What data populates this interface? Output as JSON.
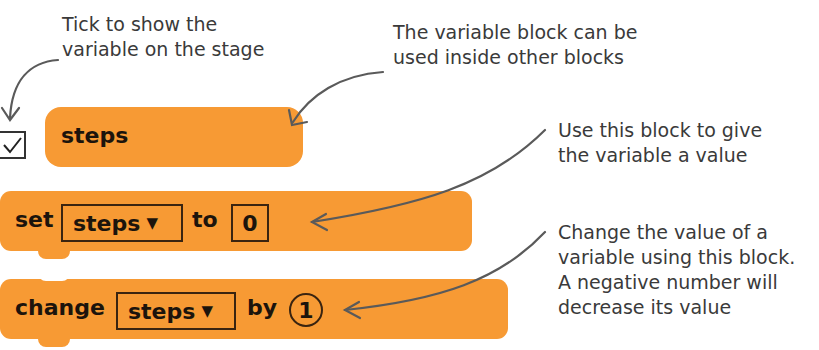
{
  "annotations": {
    "tick": [
      "Tick to show the",
      "variable on the stage"
    ],
    "reporter": [
      "The variable block can be",
      "used inside other blocks"
    ],
    "set": [
      "Use this block to give",
      "the variable a value"
    ],
    "change": [
      "Change the value of a",
      "variable using this block.",
      "A negative number will",
      "decrease its value"
    ]
  },
  "blocks": {
    "reporter": {
      "label": "steps",
      "checked": true
    },
    "set": {
      "keyword": "set",
      "variable": "steps",
      "dropdown_icon": "▼",
      "to": "to",
      "value": "0"
    },
    "change": {
      "keyword": "change",
      "variable": "steps",
      "dropdown_icon": "▼",
      "by": "by",
      "value": "1"
    }
  },
  "colors": {
    "block": "#f79a34",
    "text": "#1c140c",
    "annotation": "#3a3a3a",
    "arrow": "#5a5a5a"
  }
}
